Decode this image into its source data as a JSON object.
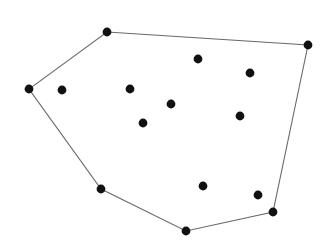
{
  "figure": {
    "width": 333,
    "height": 248,
    "background_color": "#ffffff"
  },
  "chart_data": {
    "type": "scatter",
    "xlabel": "",
    "ylabel": "",
    "xlim": [
      0,
      333
    ],
    "ylim": [
      0,
      248
    ],
    "grid": false,
    "legend": null,
    "axes_visible": false,
    "y_axis_direction": "down",
    "point_color": "#111111",
    "point_radius": 4.4,
    "hull_stroke_color": "#6a6a6a",
    "hull_stroke_width": 1.1,
    "hull_fill": "none",
    "series": [
      {
        "name": "hull-vertices",
        "role": "convex hull boundary vertices",
        "point_color": "#111111",
        "closed": true,
        "points": [
          {
            "label": "v1",
            "x": 107,
            "y": 32
          },
          {
            "label": "v2",
            "x": 308,
            "y": 45
          },
          {
            "label": "v3",
            "x": 273,
            "y": 212
          },
          {
            "label": "v4",
            "x": 186,
            "y": 231
          },
          {
            "label": "v5",
            "x": 101,
            "y": 189
          },
          {
            "label": "v6",
            "x": 29,
            "y": 89
          }
        ]
      },
      {
        "name": "interior-points",
        "role": "points strictly inside the hull",
        "point_color": "#111111",
        "closed": false,
        "points": [
          {
            "label": "p1",
            "x": 62,
            "y": 90
          },
          {
            "label": "p2",
            "x": 130,
            "y": 89
          },
          {
            "label": "p3",
            "x": 198,
            "y": 59
          },
          {
            "label": "p4",
            "x": 250,
            "y": 73
          },
          {
            "label": "p5",
            "x": 171,
            "y": 104
          },
          {
            "label": "p6",
            "x": 240,
            "y": 116
          },
          {
            "label": "p7",
            "x": 143,
            "y": 123
          },
          {
            "label": "p8",
            "x": 203,
            "y": 186
          },
          {
            "label": "p9",
            "x": 258,
            "y": 195
          }
        ]
      }
    ],
    "hull_edges": [
      {
        "from": "v1",
        "to": "v2"
      },
      {
        "from": "v2",
        "to": "v3"
      },
      {
        "from": "v3",
        "to": "v4"
      },
      {
        "from": "v4",
        "to": "v5"
      },
      {
        "from": "v5",
        "to": "v6"
      },
      {
        "from": "v6",
        "to": "v1"
      }
    ],
    "counts": {
      "hull_vertices": 6,
      "interior_points": 9,
      "total_points": 15
    }
  }
}
